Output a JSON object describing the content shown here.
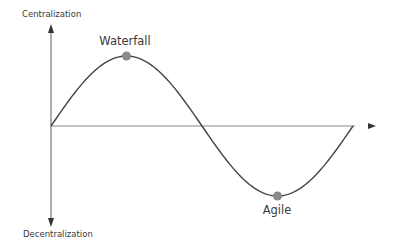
{
  "diagram": {
    "vertical_axis": {
      "top_label": "Centralization",
      "bottom_label": "Decentralization"
    },
    "horizontal_axis": {
      "label": ""
    },
    "curve": {
      "shape": "sine",
      "periods": 1
    },
    "points": [
      {
        "label": "Waterfall",
        "position": "peak"
      },
      {
        "label": "Agile",
        "position": "trough"
      }
    ],
    "colors": {
      "line": "#444444",
      "axis": "#777777",
      "dot": "#8a8a8a",
      "text": "#3a3a3a"
    }
  }
}
